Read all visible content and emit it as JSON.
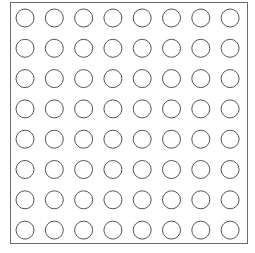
{
  "grid": {
    "rows": 8,
    "cols": 8,
    "origin_x": 25,
    "origin_y": 18,
    "step_x": 29.3,
    "step_y": 30.3,
    "radius": 9,
    "stroke": "#555555",
    "fill": "#ffffff"
  }
}
